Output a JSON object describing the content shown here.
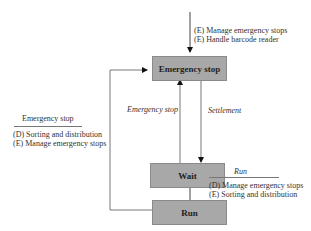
{
  "states": {
    "emergency_stop": "Emergency stop",
    "wait": "Wait",
    "run": "Run"
  },
  "top_entry": {
    "lines": [
      "(E) Manage emergency stops",
      "(E) Handle barcode reader"
    ]
  },
  "transitions": {
    "wait_to_emergency": "Emergency stop",
    "emergency_to_wait": "Settlement"
  },
  "left_annotation": {
    "title": "Emergency stop",
    "lines": [
      "(D) Sorting and distribution",
      "(E) Manage emergency stops"
    ]
  },
  "run_annotation": {
    "title": "Run",
    "lines": [
      "(D) Manage emergency stops",
      "(E) Sorting and distribution"
    ]
  },
  "colors": {
    "box_fill": "#a8a8a8",
    "box_border": "#8a8a8a",
    "line": "#555555"
  }
}
